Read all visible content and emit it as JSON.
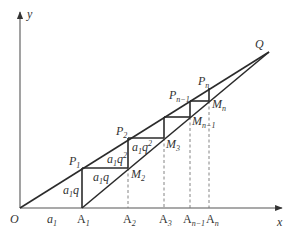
{
  "axes": {
    "x_label": "x",
    "y_label": "y",
    "origin_label": "O"
  },
  "points": {
    "Q": "Q",
    "P1": {
      "base": "P",
      "sub": "1"
    },
    "P2": {
      "base": "P",
      "sub": "2"
    },
    "Pn_1": {
      "base": "P",
      "sub": "n−1"
    },
    "Pn": {
      "base": "P",
      "sub": "n"
    },
    "M2": {
      "base": "M",
      "sub": "2"
    },
    "M3": {
      "base": "M",
      "sub": "3"
    },
    "Mn_1": {
      "base": "M",
      "sub": "n−1"
    },
    "Mn": {
      "base": "M",
      "sub": "n"
    },
    "A1": {
      "base": "A",
      "sub": "1"
    },
    "A2": {
      "base": "A",
      "sub": "2"
    },
    "A3": {
      "base": "A",
      "sub": "3"
    },
    "An_1": {
      "base": "A",
      "sub": "n−1"
    },
    "An": {
      "base": "A",
      "sub": "n"
    }
  },
  "segment_labels": {
    "OA1": {
      "base": "a",
      "sub": "1"
    },
    "P1A1": {
      "a": "a",
      "sub": "1",
      "q": "q"
    },
    "P1M2": {
      "a": "a",
      "sub": "1",
      "q": "q"
    },
    "P2M2": {
      "a": "a",
      "sub": "1",
      "q": "q",
      "exp": "2"
    },
    "P2M3": {
      "a": "a",
      "sub": "1",
      "q": "q",
      "exp": "2"
    }
  },
  "colors": {
    "line": "#2b2b2b",
    "axis": "#555555",
    "dashed": "#777777",
    "text": "#333333",
    "background": "#ffffff"
  }
}
